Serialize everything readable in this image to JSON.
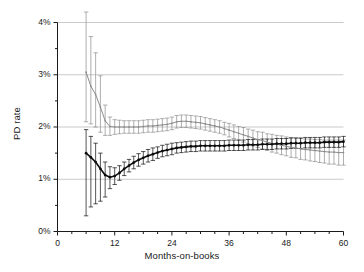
{
  "chart_data": {
    "type": "line",
    "title": "",
    "xlabel": "Months-on-books",
    "ylabel": "PD rate",
    "xlim": [
      0,
      60
    ],
    "ylim": [
      0,
      4
    ],
    "grid": true,
    "legend_position": "none",
    "xticks": [
      0,
      12,
      24,
      36,
      48,
      60
    ],
    "xtick_labels": [
      "0",
      "12",
      "24",
      "36",
      "48",
      "60"
    ],
    "xminor_tick_step": 3,
    "yticks": [
      0,
      1,
      2,
      3,
      4
    ],
    "ytick_labels": [
      "0%",
      "1%",
      "2%",
      "3%",
      "4%"
    ],
    "yminor_tick_step": 0.5,
    "y_unit": "percent",
    "series": [
      {
        "name": "upper-series",
        "color": "#8c8c8c",
        "marker": "dot",
        "errorbars": true,
        "x": [
          6,
          7,
          8,
          9,
          10,
          11,
          12,
          13,
          14,
          15,
          16,
          17,
          18,
          19,
          20,
          21,
          22,
          23,
          24,
          25,
          26,
          27,
          28,
          29,
          30,
          31,
          32,
          33,
          34,
          35,
          36,
          37,
          38,
          39,
          40,
          41,
          42,
          43,
          44,
          45,
          46,
          47,
          48,
          49,
          50,
          51,
          52,
          53,
          54,
          55,
          56,
          57,
          58,
          59,
          60
        ],
        "values": [
          3.05,
          2.78,
          2.62,
          2.38,
          2.12,
          2.01,
          2.0,
          2.0,
          2.0,
          2.0,
          2.0,
          2.0,
          2.01,
          2.02,
          2.02,
          2.03,
          2.04,
          2.05,
          2.07,
          2.1,
          2.11,
          2.11,
          2.1,
          2.09,
          2.08,
          2.06,
          2.04,
          2.02,
          2.0,
          1.97,
          1.94,
          1.91,
          1.88,
          1.85,
          1.82,
          1.79,
          1.76,
          1.74,
          1.71,
          1.69,
          1.67,
          1.65,
          1.63,
          1.61,
          1.6,
          1.58,
          1.57,
          1.56,
          1.55,
          1.54,
          1.53,
          1.52,
          1.52,
          1.51,
          1.51
        ],
        "err_low": [
          0.95,
          0.72,
          0.62,
          0.48,
          0.28,
          0.17,
          0.14,
          0.13,
          0.12,
          0.12,
          0.12,
          0.12,
          0.12,
          0.12,
          0.12,
          0.12,
          0.12,
          0.12,
          0.12,
          0.12,
          0.12,
          0.12,
          0.12,
          0.12,
          0.12,
          0.12,
          0.12,
          0.12,
          0.12,
          0.12,
          0.13,
          0.13,
          0.13,
          0.14,
          0.14,
          0.15,
          0.15,
          0.16,
          0.16,
          0.17,
          0.17,
          0.18,
          0.18,
          0.19,
          0.19,
          0.2,
          0.2,
          0.21,
          0.21,
          0.22,
          0.22,
          0.23,
          0.23,
          0.24,
          0.24
        ],
        "err_high": [
          1.2,
          0.95,
          0.8,
          0.6,
          0.3,
          0.18,
          0.14,
          0.13,
          0.12,
          0.12,
          0.12,
          0.12,
          0.12,
          0.12,
          0.12,
          0.12,
          0.12,
          0.12,
          0.12,
          0.12,
          0.12,
          0.12,
          0.12,
          0.12,
          0.12,
          0.12,
          0.12,
          0.12,
          0.12,
          0.12,
          0.13,
          0.13,
          0.13,
          0.14,
          0.14,
          0.15,
          0.15,
          0.16,
          0.16,
          0.17,
          0.17,
          0.18,
          0.18,
          0.19,
          0.19,
          0.2,
          0.2,
          0.21,
          0.21,
          0.22,
          0.22,
          0.23,
          0.23,
          0.24,
          0.24
        ]
      },
      {
        "name": "lower-series",
        "color": "#0d0d0d",
        "marker": "dot",
        "errorbars": true,
        "x": [
          6,
          7,
          8,
          9,
          10,
          11,
          12,
          13,
          14,
          15,
          16,
          17,
          18,
          19,
          20,
          21,
          22,
          23,
          24,
          25,
          26,
          27,
          28,
          29,
          30,
          31,
          32,
          33,
          34,
          35,
          36,
          37,
          38,
          39,
          40,
          41,
          42,
          43,
          44,
          45,
          46,
          47,
          48,
          49,
          50,
          51,
          52,
          53,
          54,
          55,
          56,
          57,
          58,
          59,
          60
        ],
        "values": [
          1.5,
          1.42,
          1.33,
          1.2,
          1.08,
          1.04,
          1.06,
          1.12,
          1.2,
          1.26,
          1.32,
          1.37,
          1.41,
          1.45,
          1.48,
          1.51,
          1.54,
          1.56,
          1.58,
          1.6,
          1.61,
          1.62,
          1.63,
          1.63,
          1.64,
          1.64,
          1.64,
          1.64,
          1.64,
          1.64,
          1.65,
          1.65,
          1.65,
          1.65,
          1.66,
          1.66,
          1.66,
          1.67,
          1.67,
          1.67,
          1.68,
          1.68,
          1.68,
          1.69,
          1.69,
          1.69,
          1.7,
          1.7,
          1.7,
          1.7,
          1.71,
          1.71,
          1.71,
          1.71,
          1.72
        ],
        "err_low": [
          1.2,
          0.95,
          0.8,
          0.62,
          0.42,
          0.22,
          0.16,
          0.14,
          0.13,
          0.12,
          0.12,
          0.12,
          0.12,
          0.12,
          0.12,
          0.11,
          0.11,
          0.11,
          0.11,
          0.1,
          0.1,
          0.1,
          0.1,
          0.1,
          0.1,
          0.1,
          0.1,
          0.1,
          0.1,
          0.1,
          0.1,
          0.1,
          0.1,
          0.1,
          0.1,
          0.1,
          0.1,
          0.1,
          0.1,
          0.1,
          0.1,
          0.1,
          0.1,
          0.1,
          0.1,
          0.1,
          0.1,
          0.1,
          0.1,
          0.1,
          0.1,
          0.1,
          0.1,
          0.1,
          0.1
        ],
        "err_high": [
          0.45,
          0.4,
          0.36,
          0.3,
          0.25,
          0.2,
          0.16,
          0.14,
          0.13,
          0.12,
          0.12,
          0.12,
          0.12,
          0.12,
          0.12,
          0.11,
          0.11,
          0.11,
          0.11,
          0.1,
          0.1,
          0.1,
          0.1,
          0.1,
          0.1,
          0.1,
          0.1,
          0.1,
          0.1,
          0.1,
          0.1,
          0.1,
          0.1,
          0.1,
          0.1,
          0.1,
          0.1,
          0.1,
          0.1,
          0.1,
          0.1,
          0.1,
          0.1,
          0.1,
          0.1,
          0.1,
          0.1,
          0.1,
          0.1,
          0.1,
          0.1,
          0.1,
          0.1,
          0.1,
          0.1
        ]
      }
    ],
    "colors": {
      "upper_series": "#8c8c8c",
      "lower_series": "#0d0d0d",
      "gridline": "#b3b3b3",
      "axis": "#1a1a1a",
      "background": "#ffffff"
    }
  }
}
